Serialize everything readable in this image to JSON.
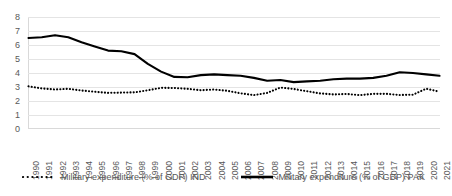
{
  "chart_data": {
    "type": "line",
    "title": "",
    "xlabel": "",
    "ylabel": "",
    "ylim": [
      0,
      8
    ],
    "yticks": [
      0,
      1,
      2,
      3,
      4,
      5,
      6,
      7,
      8
    ],
    "grid": true,
    "legend_position": "bottom",
    "categories": [
      "1990",
      "1991",
      "1992",
      "1993",
      "1994",
      "1995",
      "1996",
      "1997",
      "1998",
      "1999",
      "2000",
      "2001",
      "2002",
      "2003",
      "2004",
      "2005",
      "2006",
      "2007",
      "2008",
      "2009",
      "2010",
      "2011",
      "2012",
      "2013",
      "2014",
      "2015",
      "2016",
      "2017",
      "2018",
      "2019",
      "2020",
      "2021"
    ],
    "series": [
      {
        "name": "Military expenditure (% of GDP) IND",
        "style": "dotted",
        "color": "#000000",
        "values": [
          3.05,
          2.9,
          2.82,
          2.87,
          2.75,
          2.66,
          2.58,
          2.6,
          2.62,
          2.77,
          2.94,
          2.93,
          2.87,
          2.77,
          2.82,
          2.73,
          2.55,
          2.42,
          2.58,
          2.96,
          2.86,
          2.7,
          2.54,
          2.47,
          2.5,
          2.42,
          2.51,
          2.51,
          2.43,
          2.45,
          2.88,
          2.66
        ]
      },
      {
        "name": "Military expenditure (% of GDP) PAK",
        "style": "solid",
        "color": "#000000",
        "values": [
          6.5,
          6.55,
          6.7,
          6.55,
          6.2,
          5.9,
          5.6,
          5.55,
          5.35,
          4.65,
          4.1,
          3.72,
          3.7,
          3.85,
          3.9,
          3.85,
          3.8,
          3.65,
          3.45,
          3.5,
          3.35,
          3.4,
          3.45,
          3.55,
          3.6,
          3.6,
          3.65,
          3.8,
          4.05,
          4.0,
          3.9,
          3.8
        ]
      }
    ]
  },
  "legend": {
    "entries": [
      {
        "label": "Military expenditure (% of GDP) IND",
        "style": "dotted"
      },
      {
        "label": "Military expenditure (% of GDP) PAK",
        "style": "solid"
      }
    ]
  }
}
